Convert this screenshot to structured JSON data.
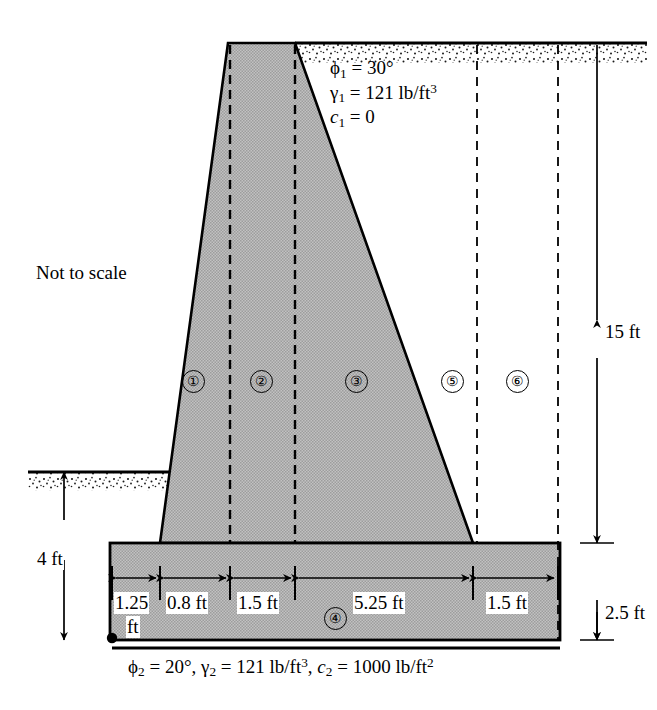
{
  "figure": {
    "note": "Not to scale",
    "backfill_soil": {
      "phi": "ϕ",
      "phi_sub": "1",
      "phi_value": "= 30°",
      "gamma": "γ",
      "gamma_sub": "1",
      "gamma_value": "= 121 lb/ft",
      "gamma_exp": "3",
      "c": "c",
      "c_sub": "1",
      "c_value": "= 0"
    },
    "foundation_soil": {
      "phi": "ϕ",
      "phi_sub": "2",
      "phi_value": "= 20°,",
      "gamma": "γ",
      "gamma_sub": "2",
      "gamma_value": "= 121 lb/ft",
      "gamma_exp": "3",
      "comma": ",",
      "c": "c",
      "c_sub": "2",
      "c_value": "= 1000 lb/ft",
      "c_exp": "2"
    },
    "regions": [
      {
        "id": "1",
        "label": "①"
      },
      {
        "id": "2",
        "label": "②"
      },
      {
        "id": "3",
        "label": "③"
      },
      {
        "id": "4",
        "label": "④"
      },
      {
        "id": "5",
        "label": "⑤"
      },
      {
        "id": "6",
        "label": "⑥"
      }
    ],
    "dimensions": {
      "horizontal": [
        {
          "name": "toe-width",
          "label": "1.25",
          "label2": "ft"
        },
        {
          "name": "stem-base-left",
          "label": "0.8 ft"
        },
        {
          "name": "stem-top-width",
          "label": "1.5 ft"
        },
        {
          "name": "heel-slope",
          "label": "5.25 ft"
        },
        {
          "name": "heel-width",
          "label": "1.5 ft"
        }
      ],
      "vertical": [
        {
          "name": "embedment-depth",
          "label": "4 ft"
        },
        {
          "name": "stem-height",
          "label": "15 ft"
        },
        {
          "name": "footing-thickness",
          "label": "2.5 ft"
        }
      ]
    },
    "colors": {
      "concrete_fill": "#b9b9b9",
      "outline": "#000000",
      "ground_stipple": "#000000",
      "background": "#ffffff"
    }
  }
}
